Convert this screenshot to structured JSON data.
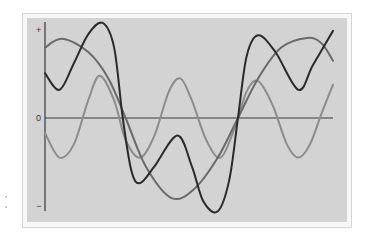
{
  "chart_data": {
    "type": "line",
    "title": "",
    "xlabel": "",
    "ylabel": "",
    "y_tick_labels": {
      "top": "+",
      "middle": "0",
      "bottom": "−"
    },
    "xlim": [
      0,
      1
    ],
    "ylim": [
      -1,
      1
    ],
    "grid": false,
    "legend": "none",
    "zero_line": true,
    "series": [
      {
        "name": "curve-dark",
        "color": "#2a2a2a",
        "points": [
          [
            0.0,
            0.51
          ],
          [
            0.05,
            0.32
          ],
          [
            0.1,
            0.62
          ],
          [
            0.15,
            0.95
          ],
          [
            0.2,
            1.08
          ],
          [
            0.24,
            0.8
          ],
          [
            0.27,
            0.0
          ],
          [
            0.3,
            -0.6
          ],
          [
            0.33,
            -0.74
          ],
          [
            0.38,
            -0.55
          ],
          [
            0.46,
            -0.2
          ],
          [
            0.51,
            -0.55
          ],
          [
            0.55,
            -0.95
          ],
          [
            0.6,
            -1.06
          ],
          [
            0.64,
            -0.7
          ],
          [
            0.67,
            0.0
          ],
          [
            0.7,
            0.7
          ],
          [
            0.74,
            0.94
          ],
          [
            0.8,
            0.75
          ],
          [
            0.88,
            0.32
          ],
          [
            0.93,
            0.6
          ],
          [
            1.0,
            0.99
          ]
        ]
      },
      {
        "name": "curve-medium",
        "color": "#6a6a6a",
        "points": [
          [
            0.0,
            0.8
          ],
          [
            0.06,
            0.9
          ],
          [
            0.15,
            0.75
          ],
          [
            0.22,
            0.45
          ],
          [
            0.28,
            0.0
          ],
          [
            0.35,
            -0.55
          ],
          [
            0.44,
            -0.91
          ],
          [
            0.52,
            -0.8
          ],
          [
            0.6,
            -0.45
          ],
          [
            0.67,
            0.0
          ],
          [
            0.74,
            0.45
          ],
          [
            0.82,
            0.8
          ],
          [
            0.91,
            0.91
          ],
          [
            0.96,
            0.85
          ],
          [
            1.0,
            0.65
          ]
        ]
      },
      {
        "name": "curve-light",
        "color": "#8c8c8c",
        "points": [
          [
            0.0,
            -0.17
          ],
          [
            0.05,
            -0.45
          ],
          [
            0.1,
            -0.3
          ],
          [
            0.15,
            0.2
          ],
          [
            0.19,
            0.48
          ],
          [
            0.24,
            0.2
          ],
          [
            0.28,
            -0.25
          ],
          [
            0.33,
            -0.45
          ],
          [
            0.38,
            -0.2
          ],
          [
            0.43,
            0.3
          ],
          [
            0.47,
            0.45
          ],
          [
            0.51,
            0.2
          ],
          [
            0.56,
            -0.25
          ],
          [
            0.61,
            -0.45
          ],
          [
            0.66,
            -0.1
          ],
          [
            0.7,
            0.3
          ],
          [
            0.74,
            0.42
          ],
          [
            0.79,
            0.15
          ],
          [
            0.84,
            -0.3
          ],
          [
            0.88,
            -0.45
          ],
          [
            0.92,
            -0.3
          ],
          [
            0.96,
            0.05
          ],
          [
            1.0,
            0.38
          ]
        ]
      }
    ]
  }
}
